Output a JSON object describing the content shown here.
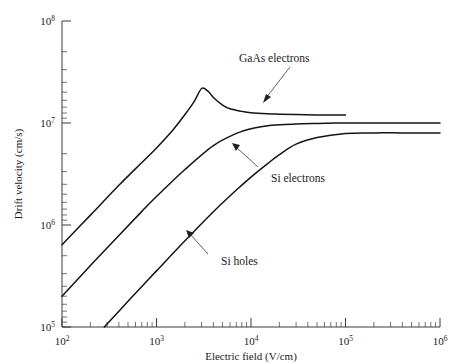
{
  "chart_data": {
    "type": "line",
    "title": "",
    "xlabel": "Electric field (V/cm)",
    "ylabel": "Drift velocity (cm/s)",
    "xscale": "log",
    "yscale": "log",
    "xlim": [
      100,
      1000000
    ],
    "ylim": [
      100000,
      100000000
    ],
    "grid": false,
    "legend_position": "inline-annotations",
    "xticks": [
      {
        "value": 100,
        "label": "10",
        "exponent": "2"
      },
      {
        "value": 1000,
        "label": "10",
        "exponent": "3"
      },
      {
        "value": 10000,
        "label": "10",
        "exponent": "4"
      },
      {
        "value": 100000,
        "label": "10",
        "exponent": "5"
      },
      {
        "value": 1000000,
        "label": "10",
        "exponent": "6"
      }
    ],
    "yticks": [
      {
        "value": 100000,
        "label": "10",
        "exponent": "5"
      },
      {
        "value": 1000000,
        "label": "10",
        "exponent": "6"
      },
      {
        "value": 10000000,
        "label": "10",
        "exponent": "7"
      },
      {
        "value": 100000000,
        "label": "10",
        "exponent": "8"
      }
    ],
    "series": [
      {
        "name": "GaAs electrons",
        "color": "#141414",
        "x": [
          100,
          200,
          400,
          700,
          1000,
          1500,
          2000,
          2500,
          3000,
          3500,
          4000,
          5000,
          6000,
          8000,
          10000,
          15000,
          20000,
          30000,
          50000,
          70000,
          100000
        ],
        "y": [
          640000,
          1250000,
          2450000,
          4100000,
          5700000,
          8600000,
          12100000.0,
          16200000.0,
          21800000.0,
          20500000.0,
          17800000.0,
          15000000.0,
          13800000.0,
          13000000.0,
          12600000.0,
          12300000.0,
          12200000.0,
          12100000.0,
          12000000.0,
          12000000.0,
          12000000.0
        ]
      },
      {
        "name": "Si electrons",
        "color": "#141414",
        "x": [
          100,
          200,
          400,
          700,
          1000,
          2000,
          4000,
          7000,
          10000,
          15000,
          20000,
          30000,
          50000,
          100000,
          200000,
          400000,
          1000000
        ],
        "y": [
          200000,
          400000,
          790000,
          1360000,
          1900000,
          3500000,
          6000000,
          7900000,
          8800000,
          9400000,
          9600000,
          9800000,
          9900000,
          10000000.0,
          10000000.0,
          10000000.0,
          10000000.0
        ]
      },
      {
        "name": "Si holes",
        "color": "#141414",
        "x": [
          280,
          400,
          700,
          1000,
          2000,
          4000,
          7000,
          10000,
          15000,
          20000,
          30000,
          50000,
          100000,
          200000,
          400000,
          1000000
        ],
        "y": [
          100000,
          143000,
          250000,
          355000,
          700000,
          1350000,
          2200000,
          2950000,
          4000000,
          4900000,
          6200000,
          7200000,
          7900000,
          8000000,
          8000000,
          8000000
        ]
      }
    ],
    "annotations": [
      {
        "text": "GaAs electrons",
        "series": "GaAs electrons"
      },
      {
        "text": "Si electrons",
        "series": "Si electrons"
      },
      {
        "text": "Si holes",
        "series": "Si holes"
      }
    ]
  }
}
